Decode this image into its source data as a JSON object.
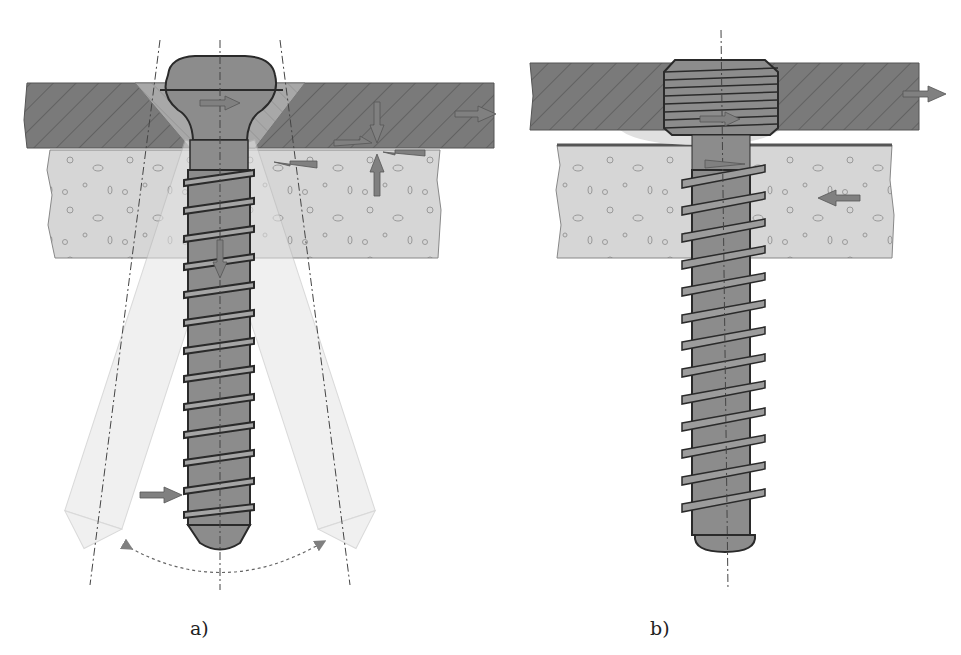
{
  "figure": {
    "panels": [
      {
        "id": "a",
        "label": "a)",
        "description": "Conventional screw with spherical head in countersunk plate hole, shown with angulated alternative positions",
        "layers": [
          "plate",
          "bone"
        ],
        "arrows": [
          "plate-right",
          "head-right",
          "compression-down",
          "compression-up",
          "shear-left",
          "shear-right",
          "screw-down",
          "shaft-right"
        ],
        "angle_indicator": "dashed arc between tilted axes"
      },
      {
        "id": "b",
        "label": "b)",
        "description": "Locking screw with threaded head fixed in plate, plate elevated above bone",
        "layers": [
          "plate",
          "bone"
        ],
        "arrows": [
          "plate-right",
          "head-right",
          "bone-left",
          "shaft-shear"
        ]
      }
    ],
    "colors": {
      "plate": "#7a7a7a",
      "plate_hatch": "#5a5a5a",
      "bone": "#d4d4d4",
      "screw": "#8c8c8c",
      "screw_ghost": "#e2e2e2",
      "outline": "#2a2a2a",
      "arrow": "#808080"
    }
  }
}
